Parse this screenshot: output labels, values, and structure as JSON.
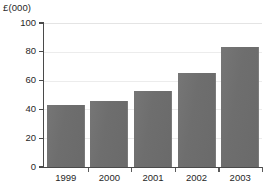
{
  "chart_data": {
    "type": "bar",
    "title": "",
    "subtitle": "",
    "xlabel": "",
    "ylabel": "£(000)",
    "categories": [
      "1999",
      "2000",
      "2001",
      "2002",
      "2003"
    ],
    "values": [
      43,
      46,
      52.5,
      65,
      83
    ],
    "series": [
      {
        "name": "",
        "values": [
          43,
          46,
          52.5,
          65,
          83
        ]
      }
    ],
    "ylim": [
      0,
      100
    ],
    "ytick_labels": [
      "0",
      "20",
      "40",
      "60",
      "80",
      "100"
    ],
    "ytick_values": [
      0,
      20,
      40,
      60,
      80,
      100
    ],
    "grid": true,
    "grid_orientation": "horizontal",
    "legend": false,
    "legend_position": "none",
    "annotations": [],
    "bar_color": "#6e6e6e",
    "grid_color": "#ececec",
    "axis_color": "#4a4a4a",
    "background_color": "#ffffff"
  },
  "axis": {
    "unit_label": "£(000)"
  }
}
